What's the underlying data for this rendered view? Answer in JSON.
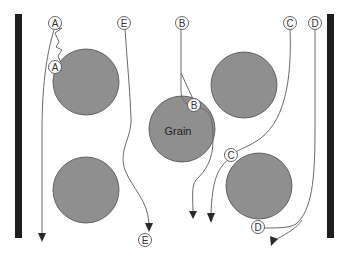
{
  "diagram": {
    "colors": {
      "grain_fill": "#8f8f8f",
      "wall": "#1e1e1e",
      "path": "#6a6a6a",
      "label_border": "#555555"
    },
    "grains": [
      {
        "id": "grain-top-left",
        "label": ""
      },
      {
        "id": "grain-center",
        "label": "Grain"
      },
      {
        "id": "grain-top-right",
        "label": ""
      },
      {
        "id": "grain-bottom-left",
        "label": ""
      },
      {
        "id": "grain-bottom-right",
        "label": ""
      }
    ],
    "labels": {
      "a_start": "A",
      "a_contact": "A",
      "e_start": "E",
      "e_end": "E",
      "b_start": "B",
      "b_contact": "B",
      "c_start": "C",
      "c_contact": "C",
      "d_start": "D",
      "d_contact": "D"
    }
  }
}
